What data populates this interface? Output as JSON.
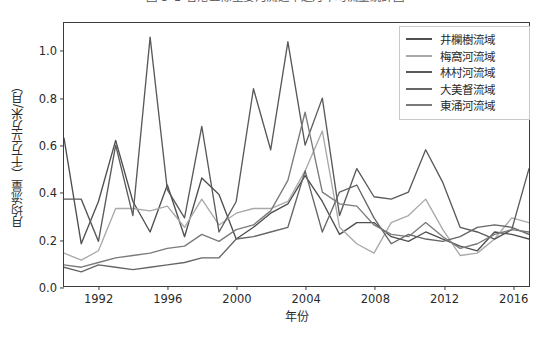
{
  "figure": {
    "title": "圖 3-1  香港五條主要河流近年逐月平均流量統計圖",
    "title_clipped": true,
    "background": "#ffffff"
  },
  "chart_data": {
    "type": "line",
    "title": "圖 3-1  香港五條主要河流近年逐月平均流量統計圖",
    "xlabel": "年份",
    "ylabel": "月均流量（千万立方米/月）",
    "xlim": [
      1990,
      2017
    ],
    "ylim": [
      0.0,
      1.12
    ],
    "xticks": [
      1992,
      1996,
      2000,
      2004,
      2008,
      2012,
      2016
    ],
    "yticks": [
      0.0,
      0.2,
      0.4,
      0.6,
      0.8,
      1.0
    ],
    "ytick_labels": [
      "0.0",
      "0.2",
      "0.4",
      "0.6",
      "0.8",
      "1.0"
    ],
    "xtick_labels": [
      "1992",
      "1996",
      "2000",
      "2004",
      "2008",
      "2012",
      "2016"
    ],
    "grid": false,
    "legend_position": "upper right",
    "x": [
      1990,
      1991,
      1992,
      1993,
      1994,
      1995,
      1996,
      1997,
      1998,
      1999,
      2000,
      2001,
      2002,
      2003,
      2004,
      2005,
      2006,
      2007,
      2008,
      2009,
      2010,
      2011,
      2012,
      2013,
      2014,
      2015,
      2016,
      2017
    ],
    "series": [
      {
        "name": "井欄樹流域",
        "color": "#4f4f4f",
        "values": [
          0.63,
          0.18,
          0.36,
          0.62,
          0.36,
          0.23,
          0.43,
          0.21,
          0.46,
          0.39,
          0.2,
          0.25,
          0.31,
          0.35,
          0.47,
          0.36,
          0.22,
          0.27,
          0.27,
          0.21,
          0.19,
          0.23,
          0.2,
          0.17,
          0.15,
          0.23,
          0.22,
          0.2
        ]
      },
      {
        "name": "梅窩河流域",
        "color": "#a9a9a9",
        "values": [
          0.14,
          0.11,
          0.15,
          0.33,
          0.33,
          0.32,
          0.34,
          0.25,
          0.37,
          0.26,
          0.31,
          0.33,
          0.33,
          0.36,
          0.49,
          0.66,
          0.25,
          0.18,
          0.14,
          0.27,
          0.3,
          0.37,
          0.24,
          0.13,
          0.14,
          0.2,
          0.29,
          0.27
        ]
      },
      {
        "name": "林村河流域",
        "color": "#5a5a5a",
        "values": [
          0.37,
          0.37,
          0.19,
          0.6,
          0.3,
          1.06,
          0.41,
          0.29,
          0.68,
          0.23,
          0.36,
          0.84,
          0.58,
          1.04,
          0.6,
          0.8,
          0.3,
          0.5,
          0.38,
          0.37,
          0.4,
          0.58,
          0.44,
          0.25,
          0.23,
          0.2,
          0.24,
          0.5
        ]
      },
      {
        "name": "大美督流域",
        "color": "#666666",
        "values": [
          0.08,
          0.06,
          0.09,
          0.08,
          0.07,
          0.08,
          0.09,
          0.1,
          0.12,
          0.12,
          0.2,
          0.21,
          0.23,
          0.25,
          0.49,
          0.23,
          0.4,
          0.43,
          0.29,
          0.18,
          0.22,
          0.2,
          0.19,
          0.21,
          0.25,
          0.26,
          0.25,
          0.22
        ]
      },
      {
        "name": "東涌河流域",
        "color": "#7a7a7a",
        "values": [
          0.09,
          0.08,
          0.1,
          0.12,
          0.13,
          0.14,
          0.16,
          0.17,
          0.22,
          0.19,
          0.24,
          0.26,
          0.32,
          0.45,
          0.74,
          0.4,
          0.35,
          0.34,
          0.26,
          0.22,
          0.21,
          0.27,
          0.21,
          0.16,
          0.18,
          0.22,
          0.24,
          0.23
        ]
      }
    ]
  }
}
